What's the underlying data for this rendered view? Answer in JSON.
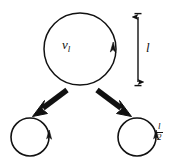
{
  "diagram": {
    "type": "energy-cascade-eddy-diagram",
    "background_color": "#ffffff",
    "stroke_color": "#111111",
    "parent_eddy": {
      "name": "parent-eddy",
      "velocity_label": "v",
      "velocity_subscript": "l",
      "size_label": "l",
      "center_x": 80,
      "center_y": 49,
      "radius": 36,
      "rotation_arrowhead": "up-right-counterclockwise"
    },
    "scale_bar": {
      "name": "length-scale-bar",
      "label": "l",
      "orientation": "vertical",
      "double_headed": true,
      "x": 138,
      "y_top": 13,
      "y_bottom": 86
    },
    "child_eddies": [
      {
        "name": "child-eddy-left",
        "center_x": 30,
        "center_y": 137,
        "radius": 19,
        "label": "",
        "rotation_arrowhead": "up-right-counterclockwise"
      },
      {
        "name": "child-eddy-right",
        "center_x": 137,
        "center_y": 137,
        "radius": 19,
        "label_numerator": "l",
        "label_denominator": "2",
        "rotation_arrowhead": "up-right-counterclockwise"
      }
    ],
    "cascade_arrows": [
      {
        "name": "cascade-arrow-left",
        "direction": "down-left",
        "from_x": 65,
        "from_y": 89,
        "to_x": 38,
        "to_y": 113
      },
      {
        "name": "cascade-arrow-right",
        "direction": "down-right",
        "from_x": 99,
        "from_y": 89,
        "to_x": 126,
        "to_y": 113
      }
    ]
  }
}
